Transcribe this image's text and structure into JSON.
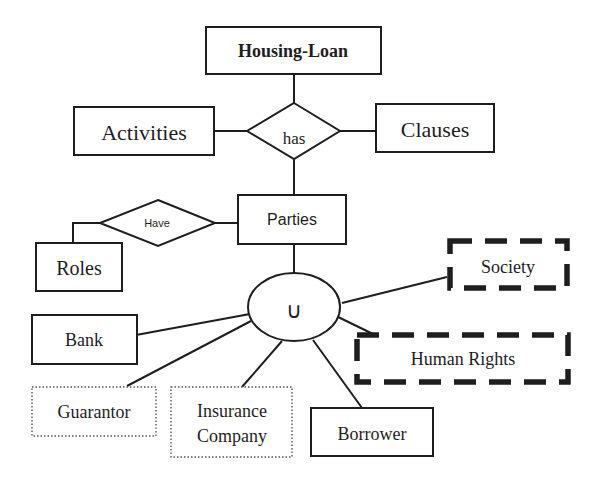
{
  "diagram": {
    "type": "entity-relationship",
    "colors": {
      "stroke": "#1e1e1e",
      "background": "#ffffff"
    },
    "entities": {
      "housing_loan": {
        "label": "Housing-Loan",
        "style": "solid-bold"
      },
      "activities": {
        "label": "Activities",
        "style": "solid"
      },
      "clauses": {
        "label": "Clauses",
        "style": "solid"
      },
      "parties": {
        "label": "Parties",
        "style": "solid"
      },
      "roles": {
        "label": "Roles",
        "style": "solid"
      },
      "bank": {
        "label": "Bank",
        "style": "solid"
      },
      "guarantor": {
        "label": "Guarantor",
        "style": "dotted"
      },
      "insurance_company": {
        "label_line1": "Insurance",
        "label_line2": "Company",
        "style": "dotted"
      },
      "borrower": {
        "label": "Borrower",
        "style": "solid"
      },
      "society": {
        "label": "Society",
        "style": "dashed-thick"
      },
      "human_rights": {
        "label": "Human Rights",
        "style": "dashed-thick"
      }
    },
    "relationships": {
      "has": {
        "label": "has",
        "connects": [
          "Housing-Loan",
          "Activities",
          "Clauses",
          "Parties"
        ]
      },
      "have": {
        "label": "Have",
        "connects": [
          "Parties",
          "Roles"
        ]
      }
    },
    "union": {
      "symbol": "∪",
      "connects": [
        "Parties",
        "Bank",
        "Guarantor",
        "Insurance Company",
        "Borrower",
        "Society",
        "Human Rights"
      ]
    }
  }
}
